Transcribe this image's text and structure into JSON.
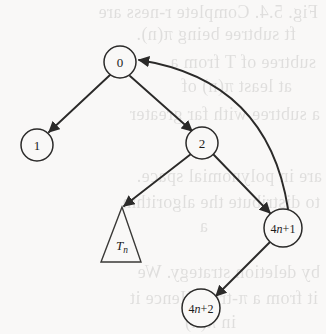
{
  "figure": {
    "kind": "directed-graph-diagram",
    "background_color": "#f9f8f7",
    "ink_color": "#2b2a29",
    "width": 326,
    "height": 334
  },
  "nodes": [
    {
      "id": "n0",
      "label": "0",
      "cx": 120,
      "cy": 62,
      "r": 16,
      "font_size": 13,
      "shape": "circle"
    },
    {
      "id": "n1",
      "label": "1",
      "cx": 37,
      "cy": 145,
      "r": 16,
      "font_size": 13,
      "shape": "circle"
    },
    {
      "id": "n2",
      "label": "2",
      "cx": 202,
      "cy": 143,
      "r": 16,
      "font_size": 13,
      "shape": "circle"
    },
    {
      "id": "n4n1",
      "label": "4n+1",
      "cx": 283,
      "cy": 228,
      "r": 19,
      "font_size": 12,
      "shape": "circle"
    },
    {
      "id": "n4n2",
      "label": "4n+2",
      "cx": 201,
      "cy": 308,
      "r": 19,
      "font_size": 12,
      "shape": "circle"
    }
  ],
  "subtree": {
    "id": "tn",
    "label": "T",
    "subscript": "n",
    "shape": "triangle",
    "apex_x": 122,
    "apex_y": 207,
    "base_left_x": 101,
    "base_right_x": 141,
    "base_y": 262,
    "label_x": 122,
    "label_y": 250,
    "font_size": 13
  },
  "edges": [
    {
      "id": "e-0-1",
      "from": "0",
      "to": "1",
      "type": "straight",
      "arrow": "target",
      "x1": 110,
      "y1": 75,
      "x2": 49,
      "y2": 132
    },
    {
      "id": "e-0-2",
      "from": "0",
      "to": "2",
      "type": "straight",
      "arrow": "target",
      "x1": 130,
      "y1": 76,
      "x2": 192,
      "y2": 131
    },
    {
      "id": "e-2-tn",
      "from": "2",
      "to": "Tn",
      "type": "straight",
      "arrow": "target",
      "x1": 191,
      "y1": 154,
      "x2": 124,
      "y2": 206
    },
    {
      "id": "e-2-4n1",
      "from": "2",
      "to": "4n+1",
      "type": "straight",
      "arrow": "target",
      "x1": 213,
      "y1": 154,
      "x2": 270,
      "y2": 213
    },
    {
      "id": "e-4n1-4n2",
      "from": "4n+1",
      "to": "4n+2",
      "type": "straight",
      "arrow": "target",
      "x1": 271,
      "y1": 241,
      "x2": 216,
      "y2": 296
    },
    {
      "id": "e-4n1-0",
      "from": "4n+1",
      "to": "0",
      "type": "curved",
      "arrow": "target",
      "x1": 288,
      "y1": 209,
      "cx": 268,
      "cy": 80,
      "x2": 139,
      "y2": 60
    }
  ],
  "bleed_text": [
    {
      "text": "Fig. 5.4. Complete r-ness are",
      "x": 8,
      "y": 2,
      "size": 18
    },
    {
      "text": "ft subtree being  π(n).",
      "x": 30,
      "y": 24,
      "size": 18
    },
    {
      "text": "subtree of T from a",
      "x": 10,
      "y": 52,
      "size": 18
    },
    {
      "text": "at least π(n) of",
      "x": 34,
      "y": 76,
      "size": 18
    },
    {
      "text": "a subtree with far greater",
      "x": 6,
      "y": 104,
      "size": 18
    },
    {
      "text": "a",
      "x": 120,
      "y": 130,
      "size": 18
    },
    {
      "text": "are in polynomial space.",
      "x": 4,
      "y": 166,
      "size": 18
    },
    {
      "text": "to distribute the algorithm",
      "x": 6,
      "y": 192,
      "size": 18
    },
    {
      "text": "a",
      "x": 118,
      "y": 216,
      "size": 18
    },
    {
      "text": "by deletion strategy. We",
      "x": 6,
      "y": 262,
      "size": 18
    },
    {
      "text": "it from a π-tree. Hence it",
      "x": 8,
      "y": 288,
      "size": 18
    },
    {
      "text": "in  π(n)",
      "x": 90,
      "y": 312,
      "size": 18
    }
  ]
}
